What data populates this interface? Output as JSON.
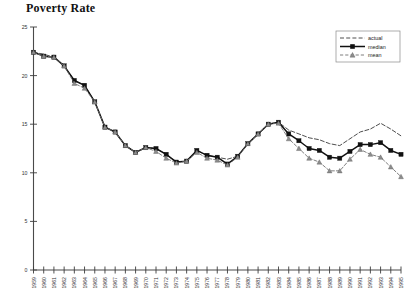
{
  "chart_data": {
    "type": "line",
    "title": "Poverty Rate",
    "xlabel": "",
    "ylabel": "",
    "ylim": [
      0,
      25
    ],
    "yticks": [
      0,
      5,
      10,
      15,
      20,
      25
    ],
    "grid": false,
    "legend_position": "top-right",
    "categories": [
      "1959",
      "1960",
      "1961",
      "1962",
      "1963",
      "1964",
      "1965",
      "1966",
      "1967",
      "1968",
      "1969",
      "1970",
      "1971",
      "1972",
      "1973",
      "1974",
      "1975",
      "1976",
      "1977",
      "1978",
      "1979",
      "1980",
      "1981",
      "1982",
      "1983",
      "1984",
      "1985",
      "1986",
      "1987",
      "1988",
      "1989",
      "1990",
      "1991",
      "1992",
      "1993",
      "1994",
      "1995"
    ],
    "series": [
      {
        "name": "actual",
        "marker": "none",
        "line_style": "dashed",
        "values": [
          22.4,
          22.2,
          21.9,
          21.0,
          19.5,
          19.0,
          17.3,
          14.7,
          14.2,
          12.8,
          12.1,
          12.6,
          12.5,
          11.9,
          11.1,
          11.2,
          12.3,
          11.8,
          11.6,
          11.4,
          11.7,
          13.0,
          14.0,
          15.0,
          15.2,
          14.4,
          14.0,
          13.6,
          13.4,
          13.0,
          12.8,
          13.5,
          14.2,
          14.5,
          15.1,
          14.5,
          13.8
        ]
      },
      {
        "name": "median",
        "marker": "square",
        "line_style": "solid",
        "values": [
          22.4,
          22.0,
          21.9,
          21.0,
          19.5,
          19.0,
          17.3,
          14.7,
          14.2,
          12.8,
          12.1,
          12.6,
          12.5,
          11.9,
          11.1,
          11.2,
          12.3,
          11.8,
          11.6,
          10.9,
          11.7,
          13.0,
          14.0,
          15.0,
          15.2,
          14.0,
          13.3,
          12.5,
          12.3,
          11.6,
          11.5,
          12.2,
          12.9,
          12.9,
          13.1,
          12.3,
          11.9
        ]
      },
      {
        "name": "mean",
        "marker": "triangle",
        "line_style": "dashed",
        "values": [
          22.4,
          22.0,
          21.9,
          21.0,
          19.2,
          18.7,
          17.3,
          14.7,
          14.2,
          12.8,
          12.1,
          12.6,
          12.2,
          11.5,
          11.0,
          11.2,
          12.1,
          11.5,
          11.3,
          10.8,
          11.6,
          13.0,
          14.0,
          15.0,
          15.1,
          13.5,
          12.5,
          11.5,
          11.1,
          10.2,
          10.2,
          11.4,
          12.4,
          11.9,
          11.6,
          10.6,
          9.6
        ]
      }
    ]
  },
  "legend": {
    "entries": [
      {
        "label": "actual"
      },
      {
        "label": "median"
      },
      {
        "label": "mean"
      }
    ]
  }
}
